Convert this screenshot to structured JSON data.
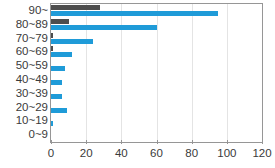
{
  "chart_data": {
    "type": "bar",
    "orientation": "horizontal",
    "title": "",
    "subtitle": "",
    "xlabel": "",
    "ylabel": "",
    "xlim": [
      0,
      120
    ],
    "xticks": [
      0,
      20,
      40,
      60,
      80,
      100,
      120
    ],
    "grid": true,
    "legend": "none",
    "categories": [
      "90~",
      "80~89",
      "70~79",
      "60~69",
      "50~59",
      "40~49",
      "30~39",
      "20~29",
      "10~19",
      "0~9"
    ],
    "series": [
      {
        "name": "series-a",
        "color": "#4d4d4d",
        "values": [
          28,
          10,
          1,
          1,
          0,
          0,
          0,
          0,
          0,
          0
        ]
      },
      {
        "name": "series-b",
        "color": "#1f9bd8",
        "values": [
          95,
          60,
          24,
          12,
          8,
          6,
          6,
          9,
          1,
          0
        ]
      }
    ]
  },
  "axes": {
    "frame_color": "#969696",
    "grid_color": "#e4e4e4",
    "tick_label_color": "#3a3a3a"
  }
}
